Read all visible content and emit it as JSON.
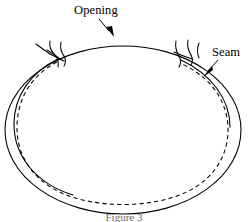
{
  "figure": {
    "background_color": "#ffffff",
    "line_color": "#000000",
    "labels": {
      "opening": "Opening",
      "seam": "Seam"
    },
    "caption": "Figure 3",
    "annotations": [
      {
        "name": "opening",
        "label": "Opening",
        "label_x": 74,
        "label_y": 13,
        "leader_from": [
          100,
          18
        ],
        "leader_to": [
          110,
          35
        ],
        "points_to": "top-rim-of-ellipse"
      },
      {
        "name": "seam",
        "label": "Seam",
        "label_x": 212,
        "label_y": 56,
        "leader_from": [
          218,
          60
        ],
        "leader_to": [
          205,
          74
        ],
        "points_to": "dashed-seam-line"
      }
    ],
    "shapes": [
      {
        "name": "outer-rim-ellipse",
        "type": "ellipse",
        "style": "solid",
        "cx": 123,
        "cy": 130,
        "rx": 118,
        "ry": 84
      },
      {
        "name": "seam-ellipse",
        "type": "ellipse",
        "style": "dashed",
        "cx": 122,
        "cy": 131,
        "rx": 105,
        "ry": 72
      },
      {
        "name": "inner-rim-arc-left",
        "type": "arc",
        "style": "solid",
        "description": "solid inner rim arc on left side from left stitch downward"
      }
    ],
    "stitches": [
      {
        "name": "stitch-left",
        "x": 56,
        "y": 56
      },
      {
        "name": "stitch-right",
        "x": 181,
        "y": 55
      }
    ]
  }
}
